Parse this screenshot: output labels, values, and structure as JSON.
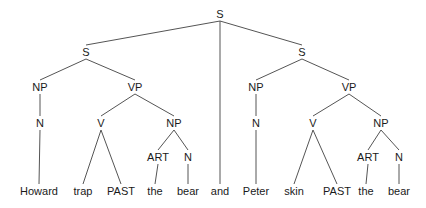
{
  "diagram": {
    "type": "syntax-tree",
    "line_color": "#555555",
    "text_color": "#1a1a1a",
    "nodes": [
      {
        "id": "s0",
        "label": "S",
        "x": 220,
        "y": 14
      },
      {
        "id": "s1",
        "label": "S",
        "x": 86,
        "y": 52
      },
      {
        "id": "s2",
        "label": "S",
        "x": 302,
        "y": 52
      },
      {
        "id": "np1",
        "label": "NP",
        "x": 40,
        "y": 87
      },
      {
        "id": "vp1",
        "label": "VP",
        "x": 135,
        "y": 87
      },
      {
        "id": "np2",
        "label": "NP",
        "x": 256,
        "y": 87
      },
      {
        "id": "vp2",
        "label": "VP",
        "x": 349,
        "y": 87
      },
      {
        "id": "n1",
        "label": "N",
        "x": 40,
        "y": 123
      },
      {
        "id": "v1",
        "label": "V",
        "x": 101,
        "y": 123
      },
      {
        "id": "np3",
        "label": "NP",
        "x": 174,
        "y": 123
      },
      {
        "id": "n2",
        "label": "N",
        "x": 256,
        "y": 123
      },
      {
        "id": "v2",
        "label": "V",
        "x": 313,
        "y": 123
      },
      {
        "id": "np4",
        "label": "NP",
        "x": 381,
        "y": 123
      },
      {
        "id": "art1",
        "label": "ART",
        "x": 158,
        "y": 157
      },
      {
        "id": "n3",
        "label": "N",
        "x": 188,
        "y": 157
      },
      {
        "id": "art2",
        "label": "ART",
        "x": 368,
        "y": 157
      },
      {
        "id": "n4",
        "label": "N",
        "x": 399,
        "y": 157
      },
      {
        "id": "w1",
        "label": "Howard",
        "x": 39,
        "y": 191
      },
      {
        "id": "w2",
        "label": "trap",
        "x": 83,
        "y": 191
      },
      {
        "id": "w3",
        "label": "PAST",
        "x": 121,
        "y": 191
      },
      {
        "id": "w4",
        "label": "the",
        "x": 155,
        "y": 191
      },
      {
        "id": "w5",
        "label": "bear",
        "x": 188,
        "y": 191
      },
      {
        "id": "w6",
        "label": "and",
        "x": 220,
        "y": 191
      },
      {
        "id": "w7",
        "label": "Peter",
        "x": 256,
        "y": 191
      },
      {
        "id": "w8",
        "label": "skin",
        "x": 294,
        "y": 191
      },
      {
        "id": "w9",
        "label": "PAST",
        "x": 337,
        "y": 191
      },
      {
        "id": "w10",
        "label": "the",
        "x": 366,
        "y": 191
      },
      {
        "id": "w11",
        "label": "bear",
        "x": 399,
        "y": 191
      }
    ],
    "edges": [
      [
        "s0",
        "s1"
      ],
      [
        "s0",
        "w6"
      ],
      [
        "s0",
        "s2"
      ],
      [
        "s1",
        "np1"
      ],
      [
        "s1",
        "vp1"
      ],
      [
        "np1",
        "n1"
      ],
      [
        "n1",
        "w1"
      ],
      [
        "vp1",
        "v1"
      ],
      [
        "vp1",
        "np3"
      ],
      [
        "v1",
        "w2"
      ],
      [
        "v1",
        "w3"
      ],
      [
        "np3",
        "art1"
      ],
      [
        "np3",
        "n3"
      ],
      [
        "art1",
        "w4"
      ],
      [
        "n3",
        "w5"
      ],
      [
        "s2",
        "np2"
      ],
      [
        "s2",
        "vp2"
      ],
      [
        "np2",
        "n2"
      ],
      [
        "n2",
        "w7"
      ],
      [
        "vp2",
        "v2"
      ],
      [
        "vp2",
        "np4"
      ],
      [
        "v2",
        "w8"
      ],
      [
        "v2",
        "w9"
      ],
      [
        "np4",
        "art2"
      ],
      [
        "np4",
        "n4"
      ],
      [
        "art2",
        "w10"
      ],
      [
        "n4",
        "w11"
      ]
    ]
  }
}
